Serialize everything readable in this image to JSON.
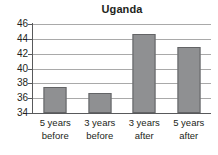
{
  "chart_data": {
    "type": "bar",
    "title": "Uganda",
    "xlabel": "",
    "ylabel": "",
    "categories": [
      "5 years before",
      "3 years before",
      "3 years after",
      "5 years after"
    ],
    "category_lines": [
      [
        "5 years",
        "before"
      ],
      [
        "3 years",
        "before"
      ],
      [
        "3 years",
        "after"
      ],
      [
        "5 years",
        "after"
      ]
    ],
    "values": [
      37.5,
      36.7,
      44.7,
      42.9
    ],
    "ylim": [
      34,
      46
    ],
    "ytick_labels": [
      "46",
      "44",
      "42",
      "40",
      "38",
      "36",
      "34"
    ],
    "ytick_values": [
      46,
      44,
      42,
      40,
      38,
      36,
      34
    ],
    "grid": "horizontal",
    "legend": "none",
    "colors": {
      "bar_fill": "#8f9092",
      "bar_border": "#636466",
      "gridline": "#a9a9a9",
      "axis": "#58595b",
      "text": "#231f20",
      "background": "#ffffff"
    }
  }
}
